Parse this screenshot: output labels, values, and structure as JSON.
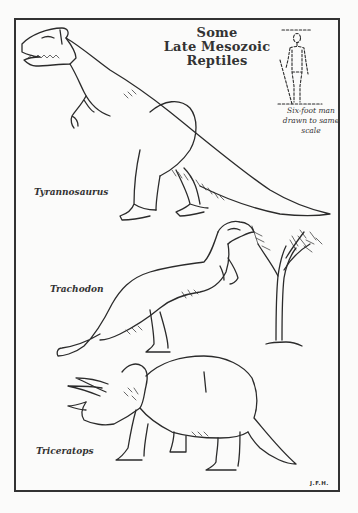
{
  "illustration": {
    "title_lines": [
      "Some",
      "Late Mesozoic",
      "Reptiles"
    ],
    "scale_note_lines": [
      "Six-foot man",
      "drawn to same",
      "scale"
    ],
    "creatures": [
      {
        "name": "Tyrannosaurus",
        "label": "Tyrannosaurus"
      },
      {
        "name": "Trachodon",
        "label": "Trachodon"
      },
      {
        "name": "Triceratops",
        "label": "Triceratops"
      }
    ],
    "signature": "J.F.H.",
    "colors": {
      "ink": "#2b2b2b",
      "paper": "#fbfbfa"
    }
  }
}
